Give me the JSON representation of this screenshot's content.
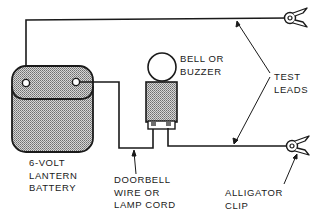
{
  "diagram": {
    "type": "wiring-diagram",
    "title": "",
    "components": [
      {
        "id": "battery",
        "label_lines": [
          "6-VOLT",
          "LANTERN",
          "BATTERY"
        ]
      },
      {
        "id": "bell",
        "label_lines": [
          "BELL OR",
          "BUZZER"
        ]
      },
      {
        "id": "wire",
        "label_lines": [
          "DOORBELL",
          "WIRE OR",
          "LAMP CORD"
        ]
      },
      {
        "id": "test-leads",
        "label_lines": [
          "TEST",
          "LEADS"
        ]
      },
      {
        "id": "alligator-clip",
        "label_lines": [
          "ALLIGATOR",
          "CLIP"
        ]
      }
    ],
    "connections": [
      {
        "from": "battery-terminal-left",
        "to": "alligator-clip-top"
      },
      {
        "from": "battery-terminal-right",
        "to": "bell-terminal-left"
      },
      {
        "from": "bell-terminal-right",
        "to": "alligator-clip-bottom"
      }
    ],
    "colors": {
      "line": "#1a1a1a",
      "fill_shade": "#a8a8a8",
      "background": "#ffffff"
    }
  },
  "labels": {
    "battery": [
      "6-VOLT",
      "LANTERN",
      "BATTERY"
    ],
    "bell": [
      "BELL OR",
      "BUZZER"
    ],
    "wire": [
      "DOORBELL",
      "WIRE OR",
      "LAMP CORD"
    ],
    "test_leads": [
      "TEST",
      "LEADS"
    ],
    "clip": [
      "ALLIGATOR",
      "CLIP"
    ]
  }
}
